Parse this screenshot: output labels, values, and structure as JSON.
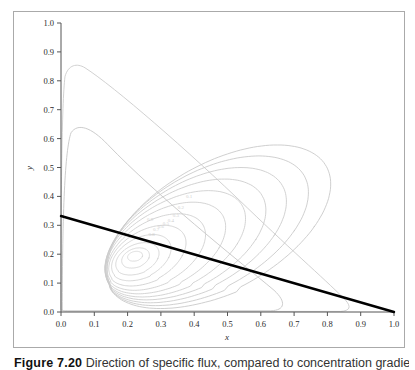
{
  "figure": {
    "caption_label": "Figure 7.20",
    "caption_text": "Direction of specific flux, compared to concentration gradient"
  },
  "chart_data": {
    "type": "line",
    "title": "",
    "xlabel": "x",
    "ylabel": "y",
    "xlim": [
      0.0,
      1.0
    ],
    "ylim": [
      0.0,
      1.0
    ],
    "grid": false,
    "legend": "none",
    "xticks": [
      "0.0",
      "0.1",
      "0.2",
      "0.3",
      "0.4",
      "0.5",
      "0.6",
      "0.7",
      "0.8",
      "0.9",
      "1.0"
    ],
    "yticks": [
      "0.0",
      "0.1",
      "0.2",
      "0.3",
      "0.4",
      "0.5",
      "0.6",
      "0.7",
      "0.8",
      "0.9",
      "1.0"
    ],
    "xtick_values": [
      0.0,
      0.1,
      0.2,
      0.3,
      0.4,
      0.5,
      0.6,
      0.7,
      0.8,
      0.9,
      1.0
    ],
    "ytick_values": [
      0.0,
      0.1,
      0.2,
      0.3,
      0.4,
      0.5,
      0.6,
      0.7,
      0.8,
      0.9,
      1.0
    ],
    "colors": {
      "contour": "#c8c8c8",
      "contour_outer": "#cccccc",
      "straight_line": "#000000",
      "axis": "#555555",
      "frame": "#aaaaaa"
    },
    "series": [
      {
        "name": "straight-line",
        "kind": "line",
        "style": "thick-black",
        "points": [
          [
            0.0,
            0.333
          ],
          [
            1.0,
            0.0
          ]
        ]
      },
      {
        "name": "contour-level-outermost",
        "kind": "closed-contour",
        "peak": [
          0.05,
          0.855
        ],
        "right_foot": [
          0.86,
          0.0
        ]
      },
      {
        "name": "contour-nest",
        "kind": "closed-contour-family",
        "count": 11,
        "center": [
          0.22,
          0.2
        ],
        "outer_peak": [
          0.115,
          0.578
        ]
      }
    ],
    "contour_labels": [
      "0.1",
      "0.2",
      "0.3",
      "0.4",
      "0.5",
      "0.6",
      "0.7",
      "0.8",
      "0.9"
    ]
  }
}
